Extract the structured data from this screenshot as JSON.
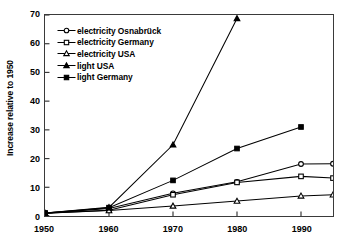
{
  "chart_data": {
    "type": "line",
    "title": "",
    "xlabel": "",
    "ylabel": "Increase relative to 1950",
    "xlim": [
      1950,
      1995
    ],
    "ylim": [
      0,
      70
    ],
    "xticks": [
      1950,
      1960,
      1970,
      1980,
      1990
    ],
    "yticks": [
      0,
      10,
      20,
      30,
      40,
      50,
      60,
      70
    ],
    "xtick_labels": [
      "1950",
      "1960",
      "1970",
      "1980",
      "1990"
    ],
    "ytick_labels": [
      "0",
      "10",
      "20",
      "30",
      "40",
      "50",
      "60",
      "70"
    ],
    "grid": false,
    "legend_position": "upper-left-inside",
    "x": [
      1950,
      1960,
      1970,
      1980,
      1990,
      1995
    ],
    "series": [
      {
        "name": "electricity Osnabrück",
        "marker": "open-circle",
        "color": "#000000",
        "values": [
          1.0,
          2.6,
          7.9,
          11.9,
          18.1,
          18.2
        ]
      },
      {
        "name": "electricity Germany",
        "marker": "open-square",
        "color": "#000000",
        "values": [
          1.0,
          2.0,
          7.4,
          11.7,
          13.8,
          13.2
        ]
      },
      {
        "name": "electricity USA",
        "marker": "open-triangle",
        "color": "#000000",
        "values": [
          1.0,
          1.9,
          3.5,
          5.2,
          7.0,
          7.4
        ]
      },
      {
        "name": "light USA",
        "marker": "filled-triangle",
        "color": "#000000",
        "values": [
          1.0,
          3.0,
          24.8,
          68.8,
          null,
          null
        ]
      },
      {
        "name": "light Germany",
        "marker": "filled-square",
        "color": "#000000",
        "values": [
          1.0,
          2.9,
          12.4,
          23.5,
          31.0,
          null
        ]
      }
    ]
  },
  "legend": {
    "items": [
      {
        "label": "electricity Osnabrück",
        "marker": "open-circle"
      },
      {
        "label": "electricity Germany",
        "marker": "open-square"
      },
      {
        "label": "electricity USA",
        "marker": "open-triangle"
      },
      {
        "label": "light USA",
        "marker": "filled-triangle"
      },
      {
        "label": "light Germany",
        "marker": "filled-square"
      }
    ]
  },
  "axes": {
    "y_title": "Increase relative to 1950"
  }
}
